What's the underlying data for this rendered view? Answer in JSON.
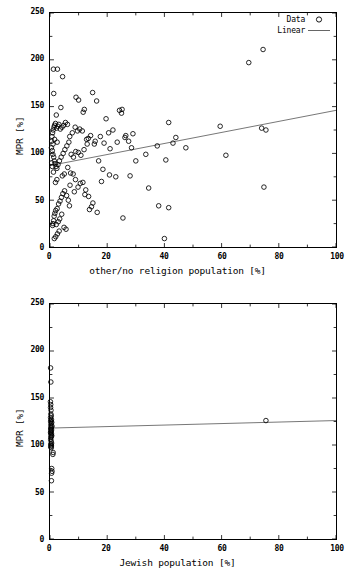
{
  "figure": {
    "panels": [
      {
        "id": "top",
        "xlabel": "other/no religion population [%]",
        "ylabel": "MPR [%]",
        "xticks": [
          "0",
          "20",
          "40",
          "60",
          "80",
          "100"
        ],
        "yticks": [
          "0",
          "50",
          "100",
          "150",
          "200",
          "250"
        ],
        "legend": [
          {
            "label": "Data",
            "symbol": "circle"
          },
          {
            "label": "Linear",
            "symbol": "line"
          }
        ]
      },
      {
        "id": "bottom",
        "xlabel": "Jewish population [%]",
        "ylabel": "MPR [%]",
        "xticks": [
          "0",
          "20",
          "40",
          "60",
          "80",
          "100"
        ],
        "yticks": [
          "0",
          "50",
          "100",
          "150",
          "200",
          "250"
        ],
        "legend": []
      }
    ]
  },
  "chart_data": [
    {
      "type": "scatter",
      "title": "",
      "xlabel": "other/no religion population [%]",
      "ylabel": "MPR [%]",
      "xlim": [
        0,
        100
      ],
      "ylim": [
        0,
        250
      ],
      "xticks": [
        0,
        20,
        40,
        60,
        80,
        100
      ],
      "yticks": [
        0,
        50,
        100,
        150,
        200,
        250
      ],
      "grid": false,
      "legend_position": "top-right",
      "series": [
        {
          "name": "Data",
          "marker": "open-circle",
          "points": [
            [
              1.2,
              190
            ],
            [
              2.6,
              190
            ],
            [
              4.4,
              182
            ],
            [
              1.3,
              164
            ],
            [
              3.8,
              149
            ],
            [
              2.2,
              141
            ],
            [
              9.1,
              160
            ],
            [
              10.0,
              157
            ],
            [
              12.0,
              147
            ],
            [
              11.6,
              144
            ],
            [
              14.9,
              165
            ],
            [
              16.3,
              156
            ],
            [
              19.6,
              137
            ],
            [
              24.3,
              146
            ],
            [
              25.2,
              147
            ],
            [
              25.0,
              143
            ],
            [
              29.0,
              121
            ],
            [
              26.5,
              119
            ],
            [
              26.2,
              117
            ],
            [
              22.0,
              125
            ],
            [
              20.5,
              122
            ],
            [
              17.6,
              118
            ],
            [
              18.9,
              111
            ],
            [
              15.5,
              110
            ],
            [
              13.4,
              116
            ],
            [
              12.8,
              115
            ],
            [
              11.3,
              124
            ],
            [
              10.4,
              126
            ],
            [
              9.6,
              124
            ],
            [
              8.8,
              128
            ],
            [
              7.8,
              122
            ],
            [
              6.9,
              118
            ],
            [
              6.1,
              131
            ],
            [
              5.4,
              133
            ],
            [
              4.8,
              130
            ],
            [
              4.2,
              128
            ],
            [
              3.6,
              126
            ],
            [
              3.1,
              131
            ],
            [
              2.7,
              129
            ],
            [
              2.3,
              127
            ],
            [
              1.9,
              132
            ],
            [
              1.6,
              130
            ],
            [
              1.4,
              128
            ],
            [
              1.1,
              125
            ],
            [
              0.9,
              122
            ],
            [
              0.7,
              118
            ],
            [
              0.6,
              113
            ],
            [
              0.5,
              106
            ],
            [
              0.8,
              103
            ],
            [
              1.0,
              99
            ],
            [
              1.3,
              96
            ],
            [
              1.5,
              92
            ],
            [
              1.8,
              89
            ],
            [
              2.1,
              86
            ],
            [
              2.4,
              84
            ],
            [
              2.8,
              88
            ],
            [
              3.3,
              92
            ],
            [
              3.9,
              96
            ],
            [
              4.6,
              100
            ],
            [
              5.2,
              104
            ],
            [
              5.9,
              108
            ],
            [
              6.6,
              112
            ],
            [
              7.4,
              99
            ],
            [
              8.2,
              96
            ],
            [
              9.0,
              102
            ],
            [
              9.9,
              101
            ],
            [
              10.8,
              98
            ],
            [
              11.9,
              104
            ],
            [
              13.0,
              110
            ],
            [
              14.2,
              119
            ],
            [
              15.8,
              113
            ],
            [
              17.0,
              92
            ],
            [
              18.5,
              83
            ],
            [
              21.0,
              105
            ],
            [
              23.5,
              112
            ],
            [
              27.5,
              113
            ],
            [
              28.5,
              106
            ],
            [
              30.0,
              92
            ],
            [
              33.5,
              99
            ],
            [
              37.5,
              108
            ],
            [
              40.5,
              93
            ],
            [
              41.5,
              133
            ],
            [
              43.0,
              111
            ],
            [
              44.0,
              117
            ],
            [
              47.5,
              106
            ],
            [
              59.5,
              129
            ],
            [
              61.5,
              98
            ],
            [
              69.5,
              197
            ],
            [
              74.5,
              211
            ],
            [
              74.0,
              127
            ],
            [
              75.5,
              125
            ],
            [
              74.8,
              64
            ],
            [
              41.5,
              42
            ],
            [
              38.0,
              44
            ],
            [
              34.5,
              63
            ],
            [
              25.5,
              31
            ],
            [
              28.0,
              76
            ],
            [
              23.0,
              75
            ],
            [
              20.8,
              77
            ],
            [
              18.0,
              70
            ],
            [
              16.5,
              37
            ],
            [
              14.5,
              43
            ],
            [
              13.8,
              40
            ],
            [
              12.5,
              61
            ],
            [
              11.5,
              69
            ],
            [
              10.6,
              68
            ],
            [
              9.8,
              64
            ],
            [
              8.9,
              72
            ],
            [
              8.1,
              78
            ],
            [
              7.2,
              79
            ],
            [
              6.4,
              50
            ],
            [
              5.8,
              55
            ],
            [
              5.1,
              60
            ],
            [
              4.5,
              57
            ],
            [
              4.0,
              53
            ],
            [
              3.5,
              49
            ],
            [
              3.0,
              46
            ],
            [
              2.5,
              41
            ],
            [
              2.0,
              39
            ],
            [
              1.7,
              36
            ],
            [
              1.45,
              33
            ],
            [
              1.25,
              28
            ],
            [
              1.05,
              25
            ],
            [
              0.9,
              23
            ],
            [
              2.2,
              24
            ],
            [
              2.9,
              27
            ],
            [
              3.4,
              30
            ],
            [
              4.1,
              35
            ],
            [
              4.9,
              21
            ],
            [
              5.6,
              19
            ],
            [
              3.2,
              17
            ],
            [
              2.6,
              14
            ],
            [
              2.0,
              11
            ],
            [
              1.5,
              9
            ],
            [
              40.0,
              9
            ],
            [
              6.2,
              85
            ],
            [
              7.0,
              66
            ],
            [
              8.5,
              59
            ],
            [
              12.2,
              56
            ],
            [
              13.5,
              54
            ],
            [
              15.0,
              47
            ],
            [
              6.8,
              44
            ],
            [
              5.0,
              78
            ],
            [
              4.3,
              76
            ],
            [
              2.4,
              72
            ],
            [
              1.9,
              69
            ],
            [
              1.2,
              80
            ],
            [
              0.8,
              86
            ],
            [
              0.6,
              90
            ],
            [
              1.05,
              110
            ],
            [
              1.6,
              115
            ],
            [
              2.5,
              112
            ]
          ]
        },
        {
          "name": "Linear",
          "type": "line",
          "x": [
            0,
            100
          ],
          "y": [
            87,
            146
          ],
          "slope": 0.59,
          "intercept": 87
        }
      ]
    },
    {
      "type": "scatter",
      "title": "",
      "xlabel": "Jewish population [%]",
      "ylabel": "MPR [%]",
      "xlim": [
        0,
        100
      ],
      "ylim": [
        0,
        250
      ],
      "xticks": [
        0,
        20,
        40,
        60,
        80,
        100
      ],
      "yticks": [
        0,
        50,
        100,
        150,
        200,
        250
      ],
      "grid": false,
      "legend_position": "none",
      "series": [
        {
          "name": "Data",
          "marker": "open-circle",
          "points": [
            [
              0.2,
              182
            ],
            [
              0.3,
              167
            ],
            [
              0.15,
              146
            ],
            [
              0.25,
              143
            ],
            [
              0.2,
              140
            ],
            [
              0.35,
              137
            ],
            [
              0.3,
              133
            ],
            [
              0.45,
              131
            ],
            [
              0.2,
              129
            ],
            [
              0.5,
              127
            ],
            [
              0.35,
              126
            ],
            [
              0.25,
              125
            ],
            [
              0.6,
              124
            ],
            [
              0.4,
              123
            ],
            [
              0.3,
              121
            ],
            [
              0.7,
              120
            ],
            [
              0.45,
              119
            ],
            [
              0.35,
              118
            ],
            [
              0.25,
              117
            ],
            [
              0.55,
              116
            ],
            [
              0.4,
              115
            ],
            [
              0.3,
              114
            ],
            [
              0.2,
              113
            ],
            [
              0.5,
              112
            ],
            [
              0.35,
              111
            ],
            [
              0.6,
              110
            ],
            [
              0.45,
              109
            ],
            [
              0.3,
              108
            ],
            [
              0.25,
              106
            ],
            [
              0.4,
              104
            ],
            [
              0.55,
              102
            ],
            [
              0.3,
              101
            ],
            [
              0.35,
              100
            ],
            [
              0.5,
              99
            ],
            [
              0.25,
              98
            ],
            [
              0.45,
              97
            ],
            [
              1.1,
              92
            ],
            [
              1.0,
              90
            ],
            [
              0.6,
              75
            ],
            [
              0.7,
              72
            ],
            [
              0.55,
              70
            ],
            [
              0.5,
              62
            ],
            [
              75.5,
              126
            ]
          ]
        },
        {
          "name": "Linear",
          "type": "line",
          "x": [
            0,
            100
          ],
          "y": [
            118,
            126
          ],
          "slope": 0.08,
          "intercept": 118
        }
      ]
    }
  ]
}
